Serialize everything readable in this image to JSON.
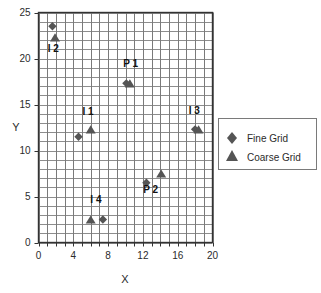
{
  "chart_data": {
    "type": "scatter",
    "title": "",
    "xlabel": "X",
    "ylabel": "Y",
    "xlim": [
      0,
      20
    ],
    "ylim": [
      0,
      25
    ],
    "xticks": [
      0,
      4,
      8,
      12,
      16,
      20
    ],
    "yticks": [
      0,
      5,
      10,
      15,
      20,
      25
    ],
    "x_minor_step": 1,
    "y_minor_step": 1,
    "grid": true,
    "grid_color": "#7a7a7a",
    "marker_color": "#555555",
    "legend_position": "right",
    "legend": [
      {
        "name": "Fine Grid",
        "marker": "diamond"
      },
      {
        "name": "Coarse Grid",
        "marker": "triangle"
      }
    ],
    "series": [
      {
        "name": "Fine Grid",
        "marker": "diamond",
        "points": [
          {
            "label": "I 2",
            "x": 1.6,
            "y": 23.5
          },
          {
            "label": "P 1",
            "x": 10.1,
            "y": 17.3
          },
          {
            "label": "I 1",
            "x": 4.6,
            "y": 11.5
          },
          {
            "label": "I 3",
            "x": 18.0,
            "y": 12.3
          },
          {
            "label": "P 2",
            "x": 12.4,
            "y": 6.5
          },
          {
            "label": "I 4",
            "x": 7.4,
            "y": 2.5
          }
        ]
      },
      {
        "name": "Coarse Grid",
        "marker": "triangle",
        "points": [
          {
            "label": "I 2",
            "x": 1.9,
            "y": 22.3
          },
          {
            "label": "P 1",
            "x": 10.5,
            "y": 17.3
          },
          {
            "label": "I 1",
            "x": 6.0,
            "y": 12.3
          },
          {
            "label": "I 3",
            "x": 18.4,
            "y": 12.3
          },
          {
            "label": "P 2",
            "x": 14.1,
            "y": 7.5
          },
          {
            "label": "I 4",
            "x": 6.0,
            "y": 2.5
          }
        ]
      }
    ],
    "annotations": [
      {
        "text": "I 2",
        "x": 1.7,
        "y": 20.7
      },
      {
        "text": "P 1",
        "x": 10.6,
        "y": 19.1
      },
      {
        "text": "I 1",
        "x": 5.7,
        "y": 13.9
      },
      {
        "text": "I 3",
        "x": 17.9,
        "y": 14.0
      },
      {
        "text": "P 2",
        "x": 12.9,
        "y": 5.4
      },
      {
        "text": "I 4",
        "x": 6.6,
        "y": 4.3
      }
    ]
  }
}
